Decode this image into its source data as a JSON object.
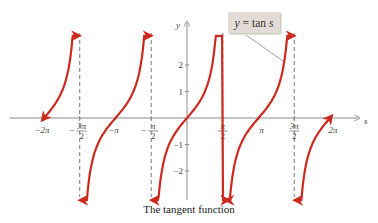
{
  "chart_data": {
    "type": "line",
    "title": "",
    "caption": "The tangent function",
    "legend_label": "y = tan s",
    "xlabel": "s",
    "ylabel": "y",
    "xlim": [
      -6.6,
      6.9
    ],
    "ylim": [
      -3.4,
      3.6
    ],
    "grid": false,
    "x_ticks": [
      {
        "value": -6.2832,
        "label": "−2π"
      },
      {
        "value": -4.7124,
        "label": "−3π/2",
        "num": "3π",
        "den": "2",
        "neg": true
      },
      {
        "value": -3.1416,
        "label": "−π"
      },
      {
        "value": -1.5708,
        "label": "−π/2",
        "num": "π",
        "den": "2",
        "neg": true
      },
      {
        "value": 1.5708,
        "label": "π/2",
        "num": "π",
        "den": "2",
        "neg": false
      },
      {
        "value": 3.1416,
        "label": "π"
      },
      {
        "value": 4.7124,
        "label": "3π/2",
        "num": "3π",
        "den": "2",
        "neg": false
      },
      {
        "value": 6.2832,
        "label": "2π"
      }
    ],
    "y_ticks": [
      {
        "value": 2,
        "label": "2"
      },
      {
        "value": 1,
        "label": "1"
      },
      {
        "value": -1,
        "label": "−1"
      },
      {
        "value": -2,
        "label": "−2"
      }
    ],
    "asymptotes": [
      -4.7124,
      -1.5708,
      1.5708,
      4.7124
    ],
    "series": [
      {
        "name": "tan s (branch −2π to −3π/2)",
        "x_range": [
          -6.2832,
          -4.85
        ],
        "color": "#cc2a1f"
      },
      {
        "name": "tan s (branch −3π/2 to −π/2)",
        "x_range": [
          -4.58,
          -1.7
        ],
        "color": "#cc2a1f"
      },
      {
        "name": "tan s (branch −π/2 to π/2)",
        "x_range": [
          -1.44,
          1.7
        ],
        "color": "#cc2a1f"
      },
      {
        "name": "tan s (branch π/2 to 3π/2)",
        "x_range": [
          1.84,
          4.58
        ],
        "color": "#cc2a1f"
      },
      {
        "name": "tan s (branch 3π/2 to 2π)",
        "x_range": [
          4.86,
          6.2832
        ],
        "color": "#cc2a1f"
      }
    ],
    "sample_points": [
      {
        "x": -3.1416,
        "y": 0
      },
      {
        "x": 0,
        "y": 0
      },
      {
        "x": 0.7854,
        "y": 1
      },
      {
        "x": -0.7854,
        "y": -1
      },
      {
        "x": 1.1071,
        "y": 2
      },
      {
        "x": -1.1071,
        "y": -2
      },
      {
        "x": 3.1416,
        "y": 0
      }
    ]
  },
  "layout": {
    "origin_px": [
      187,
      118
    ],
    "px_per_unit_x": 22.76,
    "px_per_unit_y": 26.5,
    "curve_color": "#cc2a1f",
    "axis_color": "#8a8a8a",
    "asymptote_color": "#7a7a7a"
  }
}
